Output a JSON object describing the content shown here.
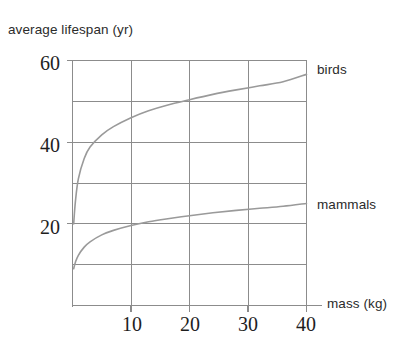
{
  "chart_data": {
    "type": "line",
    "title": "",
    "xlabel": "mass (kg)",
    "ylabel": "average lifespan (yr)",
    "xlim": [
      0,
      40
    ],
    "ylim": [
      0,
      60
    ],
    "grid": true,
    "legend_position": "right-inline",
    "x_ticks": [
      "10",
      "20",
      "30",
      "40"
    ],
    "x_tick_values": [
      10,
      20,
      30,
      40
    ],
    "y_ticks": [
      "20",
      "40",
      "60"
    ],
    "y_tick_values": [
      20,
      40,
      60
    ],
    "y_gridline_values": [
      10,
      20,
      30,
      40,
      50,
      60
    ],
    "x_gridline_values": [
      10,
      20,
      30,
      40
    ],
    "series": [
      {
        "name": "birds",
        "color": "#9a9a9a",
        "x": [
          0.2,
          0.5,
          1,
          2,
          3,
          5,
          7,
          10,
          13,
          16,
          20,
          24,
          28,
          32,
          36,
          40
        ],
        "values": [
          20,
          25.5,
          31,
          36,
          38.8,
          41.8,
          43.8,
          46,
          47.7,
          49,
          50.4,
          51.7,
          52.8,
          53.8,
          54.8,
          56.6
        ]
      },
      {
        "name": "mammals",
        "color": "#9a9a9a",
        "x": [
          0.2,
          0.5,
          1,
          2,
          3,
          5,
          7,
          10,
          13,
          16,
          20,
          24,
          28,
          32,
          36,
          40
        ],
        "values": [
          9,
          10.6,
          12.3,
          14.3,
          15.6,
          17.3,
          18.4,
          19.6,
          20.5,
          21.2,
          22.0,
          22.7,
          23.3,
          23.8,
          24.3,
          25.0
        ]
      }
    ]
  },
  "axis_titles": {
    "y": "average lifespan (yr)",
    "x": "mass (kg)"
  },
  "legend": {
    "birds": "birds",
    "mammals": "mammals"
  },
  "ticks": {
    "y": {
      "t60": "60",
      "t40": "40",
      "t20": "20"
    },
    "x": {
      "t10": "10",
      "t20": "20",
      "t30": "30",
      "t40": "40"
    }
  },
  "colors": {
    "curve": "#9a9a9a",
    "grid": "#8c8c8c",
    "axis": "#8c8c8c",
    "text": "#2b2b2b"
  }
}
